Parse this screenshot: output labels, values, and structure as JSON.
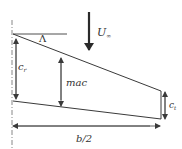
{
  "diagram": {
    "colors": {
      "line": "#3a3a3a",
      "text": "#333333",
      "background": "#ffffff"
    },
    "labels": {
      "freestream": "U",
      "freestream_sub": "∞",
      "sweep_angle": "Λ",
      "root_chord": "c",
      "root_chord_sub": "r",
      "mac": "mac",
      "tip_chord": "c",
      "tip_chord_sub": "t",
      "semi_span": "b/2"
    },
    "elements": [
      {
        "name": "centerline",
        "style": "dash-dot",
        "from": [
          12,
          20
        ],
        "to": [
          12,
          148
        ]
      },
      {
        "name": "leading-edge",
        "from": [
          13,
          34
        ],
        "to": [
          161,
          91
        ]
      },
      {
        "name": "sweep-reference-line",
        "from": [
          13,
          34
        ],
        "to": [
          67,
          34
        ]
      },
      {
        "name": "trailing-edge",
        "from": [
          13,
          101
        ],
        "to": [
          161,
          119
        ]
      },
      {
        "name": "tip-chord",
        "from": [
          161,
          91
        ],
        "to": [
          161,
          119
        ]
      },
      {
        "name": "freestream-arrow",
        "from": [
          89,
          12
        ],
        "to": [
          89,
          57
        ]
      },
      {
        "name": "root-chord-dimension",
        "from": [
          16,
          35
        ],
        "to": [
          16,
          100
        ]
      },
      {
        "name": "mac-dimension",
        "from": [
          61,
          57
        ],
        "to": [
          61,
          104
        ]
      },
      {
        "name": "tip-chord-dimension",
        "from": [
          165,
          92
        ],
        "to": [
          165,
          118
        ]
      },
      {
        "name": "semi-span-dimension",
        "from": [
          13,
          126
        ],
        "to": [
          160,
          126
        ]
      }
    ]
  }
}
